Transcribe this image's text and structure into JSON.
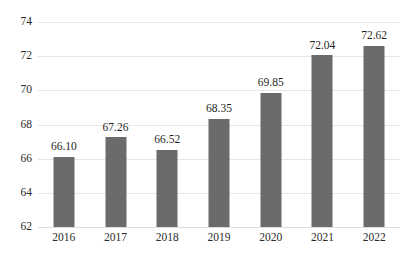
{
  "chart_data": {
    "type": "bar",
    "title": "",
    "subtitle": "",
    "xlabel": "",
    "ylabel": "",
    "categories": [
      "2016",
      "2017",
      "2018",
      "2019",
      "2020",
      "2021",
      "2022"
    ],
    "values": [
      66.1,
      67.26,
      66.52,
      68.35,
      69.85,
      72.04,
      72.62
    ],
    "data_labels": [
      "66.10",
      "67.26",
      "66.52",
      "68.35",
      "69.85",
      "72.04",
      "72.62"
    ],
    "ylim": [
      62,
      74
    ],
    "yticks": [
      62,
      64,
      66,
      68,
      70,
      72,
      74
    ],
    "ytick_labels": [
      "62",
      "64",
      "66",
      "68",
      "70",
      "72",
      "74"
    ],
    "grid": true,
    "grid_axis": "y",
    "legend": false,
    "legend_position": "none",
    "bar_color": "#6b6b6b",
    "gridline_color": "#e6e6e6",
    "text_color": "#2b2b2b",
    "background_color": "#ffffff"
  }
}
